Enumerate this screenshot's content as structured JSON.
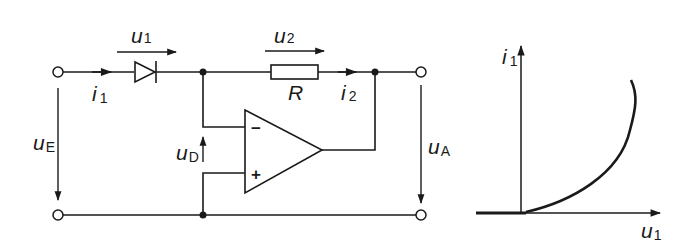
{
  "circuit": {
    "voltages": {
      "u1": {
        "symbol": "u",
        "sub": "1"
      },
      "u2": {
        "symbol": "u",
        "sub": "2"
      },
      "uE": {
        "symbol": "u",
        "sub": "E"
      },
      "uD": {
        "symbol": "u",
        "sub": "D"
      },
      "uA": {
        "symbol": "u",
        "sub": "A"
      }
    },
    "currents": {
      "i1": {
        "symbol": "i",
        "sub": "1"
      },
      "i2": {
        "symbol": "i",
        "sub": "2"
      }
    },
    "resistor": {
      "label": "R"
    },
    "opamp": {
      "minus": "−",
      "plus": "+"
    }
  },
  "graph": {
    "y_axis": {
      "symbol": "i",
      "sub": "1"
    },
    "x_axis": {
      "symbol": "u",
      "sub": "1"
    },
    "curve": "exponential diode characteristic"
  }
}
